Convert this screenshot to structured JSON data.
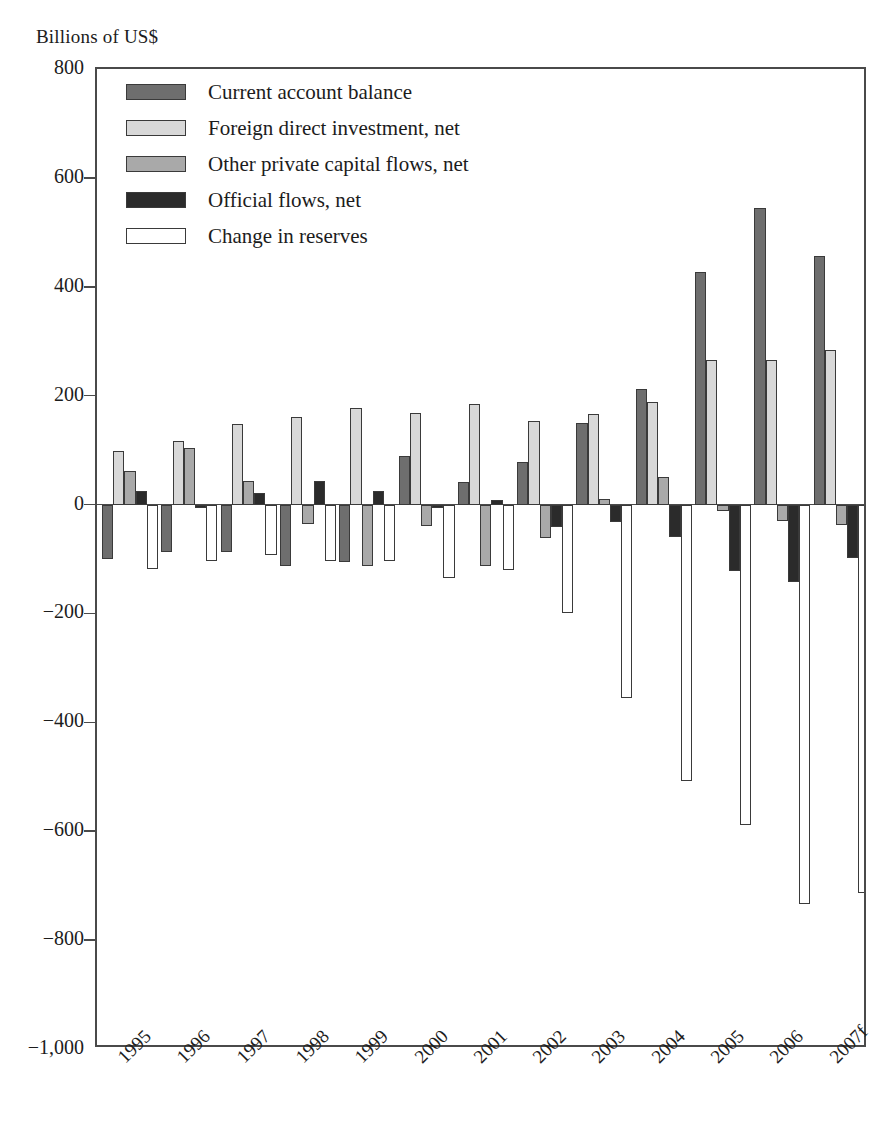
{
  "axis_title": "Billions of US$",
  "chart_data": {
    "type": "bar",
    "title": "",
    "subtitle": "",
    "xlabel": "",
    "ylabel": "Billions of US$",
    "ylim": [
      -1000,
      800
    ],
    "ytick_values": [
      800,
      600,
      400,
      200,
      0,
      -200,
      -400,
      -600,
      -800,
      -1000
    ],
    "ytick_labels": [
      "800",
      "600",
      "400",
      "200",
      "0",
      "−200",
      "−400",
      "−600",
      "−800",
      "−1,000"
    ],
    "grid": false,
    "legend_position": "top-left",
    "categories": [
      "1995",
      "1996",
      "1997",
      "1998",
      "1999",
      "2000",
      "2001",
      "2002",
      "2003",
      "2004",
      "2005",
      "2006",
      "2007f"
    ],
    "series": [
      {
        "name": "Current account balance",
        "color": "#6e6e6e",
        "values": [
          -100,
          -88,
          -87,
          -113,
          -105,
          90,
          42,
          78,
          150,
          213,
          427,
          545,
          456
        ]
      },
      {
        "name": "Foreign direct investment, net",
        "color": "#d8d8d8",
        "values": [
          99,
          117,
          148,
          160,
          178,
          169,
          185,
          154,
          166,
          189,
          266,
          266,
          283
        ]
      },
      {
        "name": "Other private capital flows, net",
        "color": "#a9a9a9",
        "values": [
          62,
          104,
          43,
          -35,
          -112,
          -40,
          -113,
          -62,
          11,
          50,
          -12,
          -30,
          -38
        ]
      },
      {
        "name": "Official flows, net",
        "color": "#2b2b2b",
        "values": [
          24,
          -6,
          22,
          44,
          25,
          -7,
          9,
          -42,
          -32,
          -60,
          -122,
          -143,
          -99
        ]
      },
      {
        "name": "Change in reserves",
        "color": "#ffffff",
        "values": [
          -118,
          -104,
          -93,
          -103,
          -104,
          -134,
          -120,
          -200,
          -355,
          -508,
          -588,
          -733,
          -713
        ]
      }
    ]
  },
  "legend": {
    "items": [
      {
        "label": "Current account balance",
        "swatch": "s0"
      },
      {
        "label": "Foreign direct investment, net",
        "swatch": "s1"
      },
      {
        "label": "Other private capital flows, net",
        "swatch": "s2"
      },
      {
        "label": "Official flows, net",
        "swatch": "s3"
      },
      {
        "label": "Change in reserves",
        "swatch": "s4"
      }
    ]
  }
}
